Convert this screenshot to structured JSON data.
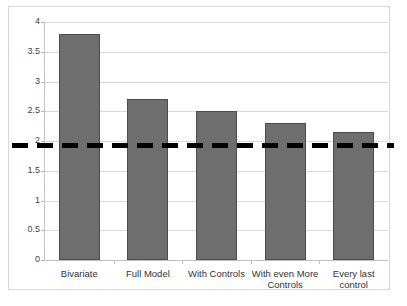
{
  "chart_data": {
    "type": "bar",
    "title": "",
    "subtitle": "",
    "xlabel": "",
    "ylabel": "",
    "categories": [
      "Bivariate",
      "Full Model",
      "With Controls",
      "With even More Controls",
      "Every last control"
    ],
    "values": [
      3.8,
      2.7,
      2.5,
      2.3,
      2.15
    ],
    "ylim": [
      0,
      4
    ],
    "ytick_labels": [
      "4",
      "3.5",
      "3",
      "2.5",
      "2",
      "1.5",
      "1",
      "0.5",
      "0"
    ],
    "ytick_values": [
      4,
      3.5,
      3,
      2.5,
      2,
      1.5,
      1,
      0.5,
      0
    ],
    "grid": true,
    "legend": false,
    "legend_position": "none",
    "bar_color": "#6e6e6e",
    "bar_edge_color": "#4c4c4c",
    "gridline_color": "#d9d9d9",
    "annotations": [
      {
        "type": "horizontal-reference-line",
        "value": 1.93,
        "style": "dashed",
        "color": "#000000",
        "label": ""
      }
    ]
  }
}
